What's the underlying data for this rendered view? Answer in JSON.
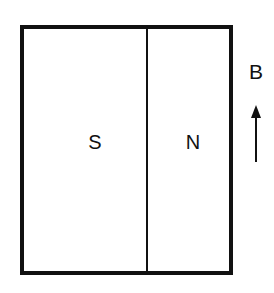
{
  "diagram": {
    "magnet": {
      "south_label": "S",
      "north_label": "N"
    },
    "field": {
      "label": "B",
      "direction": "up"
    },
    "colors": {
      "line": "#111111",
      "background": "#ffffff"
    }
  }
}
